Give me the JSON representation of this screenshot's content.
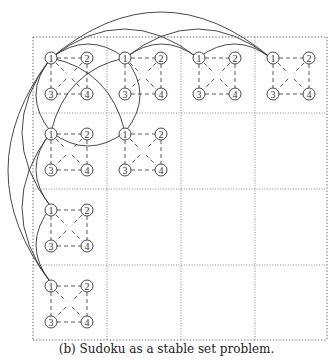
{
  "caption": "(b) Sudoku as a stable set problem.",
  "colors": {
    "stroke": "#333333",
    "grid": "#555555",
    "background": "#ffffff"
  },
  "grid": {
    "rows": 4,
    "cols": 4,
    "origin": [
      33,
      37
    ],
    "col_lines": [
      33,
      107,
      181,
      255,
      327
    ],
    "row_lines": [
      37,
      113,
      189,
      265,
      340
    ]
  },
  "cell_pattern": {
    "node_labels": [
      "1",
      "2",
      "3",
      "4"
    ],
    "node_offsets": [
      [
        18,
        21
      ],
      [
        54,
        21
      ],
      [
        18,
        57
      ],
      [
        54,
        57
      ]
    ],
    "dashed_edges": [
      [
        "1",
        "2"
      ],
      [
        "1",
        "3"
      ],
      [
        "2",
        "4"
      ],
      [
        "3",
        "4"
      ],
      [
        "1",
        "4"
      ],
      [
        "2",
        "3"
      ]
    ]
  },
  "occupied_cells": [
    [
      0,
      0
    ],
    [
      0,
      1
    ],
    [
      0,
      2
    ],
    [
      0,
      3
    ],
    [
      1,
      0
    ],
    [
      1,
      1
    ],
    [
      2,
      0
    ],
    [
      3,
      0
    ]
  ],
  "solid_arcs": {
    "row_top": [
      {
        "from": [
          51,
          58
        ],
        "to": [
          125,
          58
        ],
        "peak": 44
      },
      {
        "from": [
          51,
          58
        ],
        "to": [
          198,
          58
        ],
        "peak": 29
      },
      {
        "from": [
          51,
          58
        ],
        "to": [
          271,
          58
        ],
        "peak": 12
      },
      {
        "from": [
          125,
          58
        ],
        "to": [
          198,
          58
        ],
        "peak": 44
      },
      {
        "from": [
          125,
          58
        ],
        "to": [
          271,
          58
        ],
        "peak": 29
      },
      {
        "from": [
          198,
          58
        ],
        "to": [
          271,
          58
        ],
        "peak": 44
      }
    ],
    "col_left": [
      {
        "from": [
          51,
          58
        ],
        "to": [
          51,
          132
        ],
        "bulge": 36
      },
      {
        "from": [
          51,
          58
        ],
        "to": [
          51,
          207
        ],
        "bulge": 22
      },
      {
        "from": [
          51,
          58
        ],
        "to": [
          51,
          283
        ],
        "bulge": 8
      },
      {
        "from": [
          51,
          132
        ],
        "to": [
          51,
          207
        ],
        "bulge": 36
      },
      {
        "from": [
          51,
          132
        ],
        "to": [
          51,
          283
        ],
        "bulge": 22
      },
      {
        "from": [
          51,
          207
        ],
        "to": [
          51,
          283
        ],
        "bulge": 36
      }
    ],
    "block": [
      {
        "from": [
          125,
          58
        ],
        "to": [
          125,
          132
        ],
        "bulge_right": 140
      },
      {
        "from": [
          51,
          132
        ],
        "to": [
          125,
          132
        ],
        "bulge_down": 146
      },
      {
        "from": [
          51,
          58
        ],
        "to": [
          125,
          132
        ],
        "ctrl": [
          110,
          70
        ]
      },
      {
        "from": [
          125,
          58
        ],
        "to": [
          51,
          132
        ],
        "ctrl": [
          66,
          70
        ]
      }
    ]
  }
}
